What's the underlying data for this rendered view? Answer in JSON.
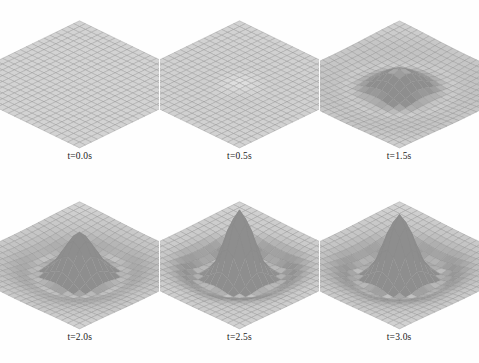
{
  "figure": {
    "type": "surface-grid-figure",
    "rows": 2,
    "columns": 3,
    "background_color": "#fefefe",
    "label_color": "#1a1a1a",
    "mesh_line_color": "#8a8a8a",
    "mesh_fill_color": "#d4d4d4",
    "mesh_highlight_color": "#f2f2f2",
    "mesh_shadow_color": "#9a9a9a"
  },
  "chart_data": {
    "type": "surface",
    "title": "",
    "xlabel": "",
    "ylabel": "",
    "zlabel": "",
    "grid": true,
    "legend": "none",
    "projection": "isometric 3D wireframe surface mesh",
    "grid_resolution": 22,
    "domain_x": [
      -1,
      1
    ],
    "domain_y": [
      -1,
      1
    ],
    "zlim": [
      -0.25,
      1.0
    ],
    "panels": [
      {
        "index": 0,
        "row": 0,
        "column": 0,
        "label": "t=0.0s",
        "time": 0.0,
        "amplitude": 0.0,
        "ring_depth": 0.0,
        "ring_radius": 0.0,
        "peak_width": 0.22,
        "peak_z": 0.0
      },
      {
        "index": 1,
        "row": 0,
        "column": 1,
        "label": "t=0.5s",
        "time": 0.5,
        "amplitude": 0.03,
        "ring_depth": 0.01,
        "ring_radius": 0.2,
        "peak_width": 0.26,
        "peak_z": 0.03
      },
      {
        "index": 2,
        "row": 0,
        "column": 2,
        "label": "t=1.5s",
        "time": 1.5,
        "amplitude": 0.34,
        "ring_depth": 0.14,
        "ring_radius": 0.3,
        "peak_width": 0.26,
        "peak_z": 0.34
      },
      {
        "index": 3,
        "row": 1,
        "column": 0,
        "label": "t=2.0s",
        "time": 2.0,
        "amplitude": 0.62,
        "ring_depth": 0.2,
        "ring_radius": 0.33,
        "peak_width": 0.2,
        "peak_z": 0.62
      },
      {
        "index": 4,
        "row": 1,
        "column": 1,
        "label": "t=2.5s",
        "time": 2.5,
        "amplitude": 0.95,
        "ring_depth": 0.22,
        "ring_radius": 0.34,
        "peak_width": 0.17,
        "peak_z": 0.95
      },
      {
        "index": 5,
        "row": 1,
        "column": 2,
        "label": "t=3.0s",
        "time": 3.0,
        "amplitude": 0.88,
        "ring_depth": 0.23,
        "ring_radius": 0.36,
        "peak_width": 0.18,
        "peak_z": 0.88
      }
    ]
  }
}
